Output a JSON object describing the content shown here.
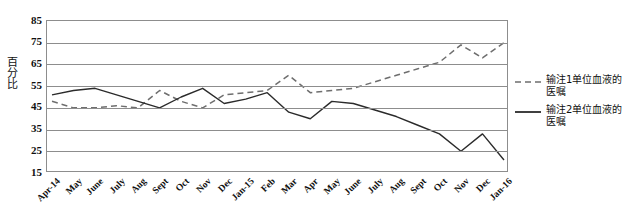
{
  "chart_data": {
    "type": "line",
    "title": "",
    "xlabel": "",
    "ylabel": "百分比",
    "ylim": [
      15,
      85
    ],
    "ytick_step": 10,
    "yticks": [
      85,
      75,
      65,
      55,
      45,
      35,
      25,
      15
    ],
    "grid": true,
    "legend_position": "right",
    "categories": [
      "Apr-14",
      "May",
      "June",
      "July",
      "Aug",
      "Sept",
      "Oct",
      "Nov",
      "Dec",
      "Jan-15",
      "Feb",
      "Mar",
      "Apr",
      "May",
      "June",
      "July",
      "Aug",
      "Sept",
      "Oct",
      "Nov",
      "Dec",
      "Jan-16"
    ],
    "series": [
      {
        "name": "输注1单位血液的医嘱",
        "style": "dashed",
        "color": "#6e6e6e",
        "values": [
          48,
          45,
          45,
          46,
          45,
          53,
          48,
          45,
          51,
          52,
          53,
          60,
          52,
          53,
          54,
          57,
          60,
          63,
          66,
          74,
          68,
          75
        ]
      },
      {
        "name": "输注2单位血液的医嘱",
        "style": "solid",
        "color": "#2b2b2b",
        "values": [
          51,
          53,
          54,
          51,
          48,
          45,
          50,
          54,
          47,
          49,
          52,
          43,
          40,
          48,
          47,
          44,
          41,
          37,
          33,
          25,
          33,
          21
        ]
      }
    ]
  },
  "legend": {
    "items": [
      {
        "label": "输注1单位血液的医嘱",
        "style": "dashed"
      },
      {
        "label": "输注2单位血液的医嘱",
        "style": "solid"
      }
    ]
  }
}
